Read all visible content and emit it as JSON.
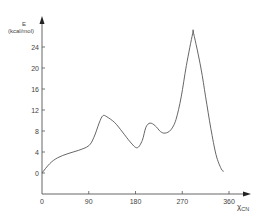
{
  "chart_data": {
    "type": "line",
    "title": "",
    "xlabel": "χ_CN",
    "xlabel_main": "χ",
    "xlabel_sub": "CN",
    "ylabel": "E (kcal/mol)",
    "ylabel_symbol": "E",
    "ylabel_unit": "(kcal/mol)",
    "xlim": [
      0,
      360
    ],
    "ylim": [
      0,
      28
    ],
    "x_ticks": [
      0,
      90,
      180,
      270,
      360
    ],
    "x_tick_labels": [
      "0",
      "90",
      "180",
      "270",
      "360"
    ],
    "y_ticks": [
      0,
      4,
      8,
      12,
      16,
      20,
      24
    ],
    "y_tick_labels": [
      "0",
      "4",
      "8",
      "12",
      "16",
      "20",
      "24"
    ],
    "grid": false,
    "legend": null,
    "series": [
      {
        "name": "E",
        "x": [
          0,
          15,
          30,
          50,
          70,
          90,
          100,
          110,
          117,
          125,
          140,
          155,
          170,
          183,
          193,
          200,
          208,
          218,
          228,
          237,
          248,
          258,
          268,
          278,
          290,
          292,
          306,
          315,
          325,
          335,
          345,
          350
        ],
        "y": [
          0,
          1.8,
          2.9,
          3.7,
          4.3,
          5.2,
          6.8,
          9.5,
          10.9,
          10.7,
          9.6,
          7.8,
          5.9,
          4.8,
          6.2,
          8.7,
          9.5,
          9.0,
          7.9,
          7.6,
          8.2,
          10.2,
          14.5,
          20.5,
          26.5,
          26.5,
          20.0,
          14.5,
          8.5,
          3.5,
          0.8,
          0.3
        ]
      }
    ],
    "annotations": [
      "curve clipped above ~26.5 kcal/mol near χ≈290°"
    ]
  }
}
